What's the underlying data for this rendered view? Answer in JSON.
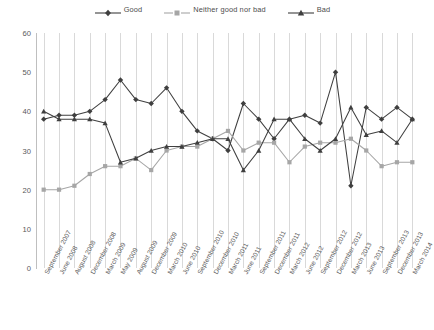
{
  "legend": {
    "position": "top-center",
    "items": [
      {
        "label": "Good",
        "color": "#3f3f3f",
        "marker": "diamond"
      },
      {
        "label": "Neither good nor bad",
        "color": "#a6a6a6",
        "marker": "square"
      },
      {
        "label": "Bad",
        "color": "#3f3f3f",
        "marker": "triangle"
      }
    ]
  },
  "chart_data": {
    "type": "line",
    "title": "",
    "xlabel": "",
    "ylabel": "",
    "ylim": [
      0,
      60
    ],
    "yticks": [
      0,
      10,
      20,
      30,
      40,
      50,
      60
    ],
    "grid": "vertical",
    "categories": [
      "September 2007",
      "June 2008",
      "August 2008",
      "December 2008",
      "March 2009",
      "May 2009",
      "August 2009",
      "December 2009",
      "March 2010",
      "June 2010",
      "September 2010",
      "December 2010",
      "March 2011",
      "June 2011",
      "September 2011",
      "December 2011",
      "March 2012",
      "June 2012",
      "September 2012",
      "December 2012",
      "March 2013",
      "June 2013",
      "September 2013",
      "December 2013",
      "March 2014"
    ],
    "series": [
      {
        "name": "Good",
        "color": "#3f3f3f",
        "marker": "diamond",
        "values": [
          38,
          39,
          39,
          40,
          43,
          48,
          43,
          42,
          46,
          40,
          35,
          33,
          30,
          42,
          38,
          33,
          38,
          39,
          37,
          50,
          21,
          41,
          38,
          41,
          38
        ]
      },
      {
        "name": "Neither good nor bad",
        "color": "#a6a6a6",
        "marker": "square",
        "values": [
          20,
          20,
          21,
          24,
          26,
          26,
          28,
          25,
          30,
          31,
          31,
          33,
          35,
          30,
          32,
          32,
          27,
          31,
          32,
          32,
          33,
          30,
          26,
          27,
          27
        ]
      },
      {
        "name": "Bad",
        "color": "#3f3f3f",
        "marker": "triangle",
        "values": [
          40,
          38,
          38,
          38,
          37,
          27,
          28,
          30,
          31,
          31,
          32,
          33,
          33,
          25,
          30,
          38,
          38,
          33,
          30,
          33,
          41,
          34,
          35,
          32,
          38
        ]
      }
    ]
  }
}
